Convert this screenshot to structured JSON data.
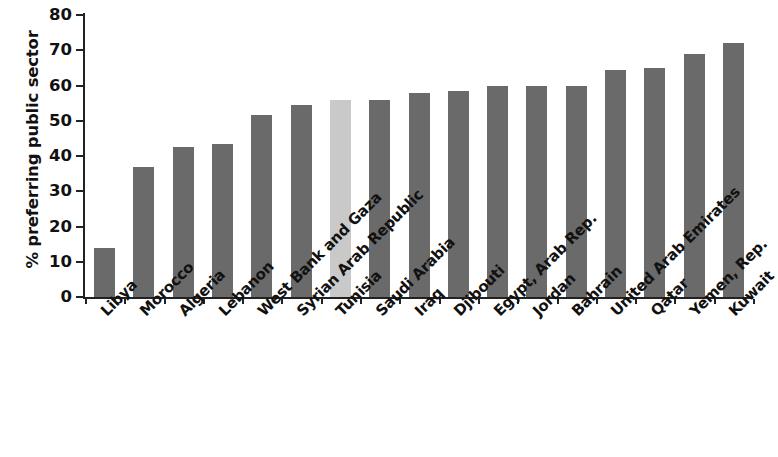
{
  "chart_data": {
    "type": "bar",
    "title": "",
    "subtitle": "",
    "xlabel": "",
    "ylabel": "% preferring public sector",
    "ylim": [
      0,
      80
    ],
    "yticks": [
      0,
      10,
      20,
      30,
      40,
      50,
      60,
      70,
      80
    ],
    "grid": false,
    "legend": null,
    "orientation": "vertical",
    "categories": [
      "Libya",
      "Morocco",
      "Algeria",
      "Lebanon",
      "West Bank and Gaza",
      "Syrian Arab Republic",
      "Tunisia",
      "Saudi Arabia",
      "Iraq",
      "Djibouti",
      "Egypt, Arab Rep.",
      "Jordan",
      "Bahrain",
      "United Arab Emirates",
      "Qatar",
      "Yemen, Rep.",
      "Kuwait"
    ],
    "values": [
      14,
      37,
      42.5,
      43.5,
      51.5,
      54.5,
      56,
      56,
      58,
      58.5,
      60,
      60,
      60,
      64.5,
      65,
      69,
      72
    ],
    "highlight_category": "Tunisia",
    "colors": {
      "bar": "#6a6a6a",
      "bar_highlight": "#c9c9c9",
      "axis": "#222222",
      "text": "#111111",
      "background": "#ffffff"
    }
  }
}
